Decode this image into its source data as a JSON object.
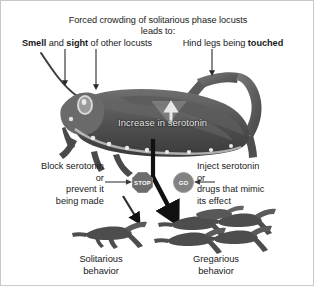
{
  "figure": {
    "title_line1": "Forced crowding of solitarious phase locusts",
    "title_line2": "leads to:",
    "cues": [
      {
        "id": "smell-sight",
        "text_bold_1": "Smell",
        "text_mid": " and ",
        "text_bold_2": "sight",
        "text_tail": " of other locusts"
      },
      {
        "id": "hind-leg-touch",
        "text_lead": "Hind legs being ",
        "text_bold": "touched"
      }
    ],
    "mechanism_label": "Increase in serotonin",
    "interventions": [
      {
        "id": "block",
        "lines": [
          "Block serotonin",
          "or",
          "prevent it",
          "being made"
        ],
        "badge": "STOP"
      },
      {
        "id": "inject",
        "lines": [
          "Inject serotonin",
          "or",
          "drugs that mimic",
          "its effect"
        ],
        "badge": "GO"
      }
    ],
    "outcomes": [
      {
        "id": "solitarious",
        "line1": "Solitarious",
        "line2": "behavior",
        "count": 1
      },
      {
        "id": "gregarious",
        "line1": "Gregarious",
        "line2": "behavior",
        "count": 5
      }
    ],
    "colors": {
      "ink": "#1a1a1a",
      "overlay_text": "#f2f2f2",
      "stop_badge": "#6d6d6d",
      "go_badge": "#828282",
      "locust_dark": "#4a4a4a",
      "locust_mid": "#6e6e6e",
      "border": "#c8c8c8"
    }
  }
}
